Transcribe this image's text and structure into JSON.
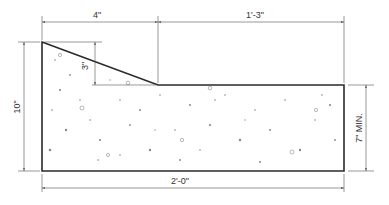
{
  "colors": {
    "outline": "#2a2a2a",
    "dimension": "#555555",
    "aggregate": "#777777",
    "background": "#ffffff"
  },
  "dimensions": {
    "top_left_width": "4\"",
    "top_right_width": "1'-3\"",
    "slope_drop": "3\"",
    "overall_height": "10\"",
    "min_depth": "7\" MIN.",
    "overall_width": "2'-0\""
  },
  "geometry": {
    "left_x": 42,
    "right_x": 344,
    "top_y": 42,
    "step_y": 85,
    "bottom_y": 171,
    "slope_end_x": 158
  }
}
